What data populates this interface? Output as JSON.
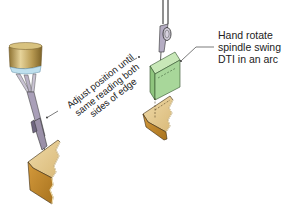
{
  "diagram": {
    "left_figure": {
      "name": "edge-finding-setup",
      "annotation_lines": [
        "Adjust position until",
        "same reading both",
        "sides of edge"
      ]
    },
    "right_figure": {
      "name": "dti-swing-setup",
      "annotation_lines": [
        "Hand rotate",
        "spindle swing",
        "DTI in an arc"
      ]
    },
    "colors": {
      "spindle_gold": "#b89a52",
      "spindle_gold_light": "#e2cf95",
      "spindle_ring": "#bfe0ee",
      "probe_gray": "#9a90a8",
      "workpiece_top": "#e6cd96",
      "workpiece_side": "#c48a2e",
      "workpiece_dark": "#9a6a1e",
      "block_green": "#a8d79a",
      "outline": "#333333",
      "text": "#222222"
    }
  }
}
